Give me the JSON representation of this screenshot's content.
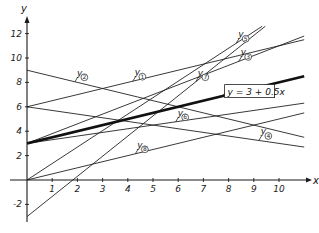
{
  "chart_data": {
    "type": "line",
    "title": "",
    "xlabel": "x",
    "ylabel": "y",
    "xlim": [
      0,
      11
    ],
    "ylim": [
      -3,
      12.6
    ],
    "grid": false,
    "x_ticks": [
      1,
      2,
      3,
      4,
      5,
      6,
      7,
      8,
      9,
      10
    ],
    "x_tick_labels": [
      "1",
      "2",
      "3",
      "4",
      "5",
      "6",
      "7",
      "8",
      "9",
      "10"
    ],
    "y_ticks": [
      -2,
      2,
      4,
      6,
      8,
      10,
      12
    ],
    "y_tick_labels": [
      "-2",
      "2",
      "4",
      "6",
      "8",
      "10",
      "12"
    ],
    "series": [
      {
        "name": "y1",
        "label": "y",
        "index": "1",
        "intercept": 6,
        "slope": 0.5,
        "bold": false,
        "label_x": 4.2
      },
      {
        "name": "y2",
        "label": "y",
        "index": "2",
        "intercept": 9,
        "slope": -0.5,
        "bold": false,
        "label_x": 1.9
      },
      {
        "name": "y3",
        "label": "y",
        "index": "3",
        "intercept": 3,
        "slope": 0.8,
        "bold": false,
        "label_x": 8.4
      },
      {
        "name": "y4",
        "label": "y",
        "index": "4",
        "intercept": 6,
        "slope": -0.3,
        "bold": false,
        "label_x": 9.2
      },
      {
        "name": "y5",
        "label": "y",
        "index": "5",
        "intercept": 0,
        "slope": 1.35,
        "bold": false,
        "label_x": 8.3
      },
      {
        "name": "y6",
        "label": "y",
        "index": "6",
        "intercept": 3,
        "slope": 0.3,
        "bold": false,
        "label_x": 5.9
      },
      {
        "name": "y7",
        "label": "y",
        "index": "7",
        "intercept": -3,
        "slope": 1.65,
        "bold": false,
        "label_x": 6.7
      },
      {
        "name": "y8",
        "label": "y",
        "index": "8",
        "intercept": 0,
        "slope": 0.5,
        "bold": false,
        "label_x": 4.3
      },
      {
        "name": "highlight",
        "label": "y = 3 + 0.5x",
        "intercept": 3,
        "slope": 0.5,
        "bold": true
      }
    ],
    "annotations": [
      {
        "text": "y = 3 + 0.5x",
        "x": 8.0,
        "y": 7.0
      }
    ]
  }
}
